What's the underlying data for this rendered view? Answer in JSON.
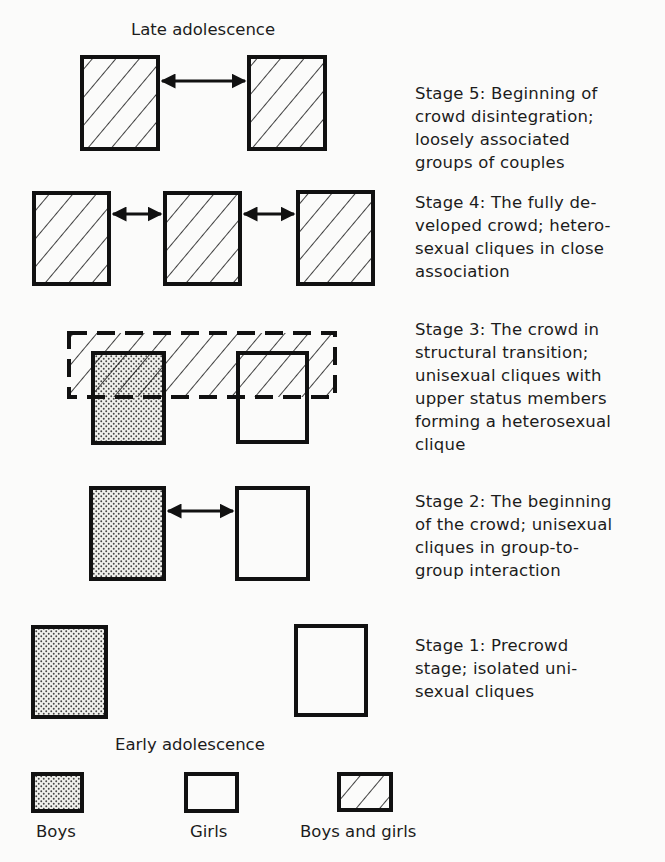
{
  "labels": {
    "top": "Late adolescence",
    "bottom": "Early adolescence"
  },
  "stages": [
    {
      "id": 5,
      "lines": [
        "Stage 5: Beginning of",
        "crowd disintegration;",
        "loosely associated",
        "groups of couples"
      ]
    },
    {
      "id": 4,
      "lines": [
        "Stage 4: The fully de-",
        "veloped crowd; hetero-",
        "sexual cliques in close",
        "association"
      ]
    },
    {
      "id": 3,
      "lines": [
        "Stage 3: The crowd in",
        "structural transition;",
        "unisexual cliques with",
        "upper status members",
        "forming a heterosexual",
        "clique"
      ]
    },
    {
      "id": 2,
      "lines": [
        "Stage 2: The beginning",
        "of the crowd; unisexual",
        "cliques in group-to-",
        "group interaction"
      ]
    },
    {
      "id": 1,
      "lines": [
        "Stage 1: Precrowd",
        "stage; isolated uni-",
        "sexual cliques"
      ]
    }
  ],
  "legend": [
    {
      "label": "Boys",
      "pattern": "dotted"
    },
    {
      "label": "Girls",
      "pattern": "blank"
    },
    {
      "label": "Boys and girls",
      "pattern": "hatched"
    }
  ],
  "colors": {
    "stroke": "#111111",
    "dot_fill": "#d8d8d4",
    "background": "#fbfbfa"
  }
}
